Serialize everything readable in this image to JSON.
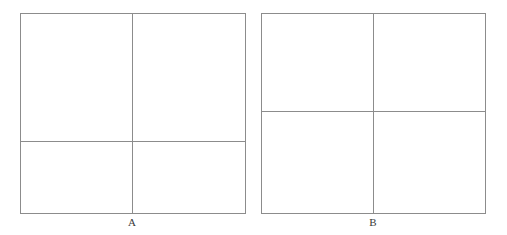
{
  "page": {
    "background_color": "#ffffff",
    "width": 507,
    "height": 235,
    "line_color": "#8c8c8c",
    "label_color": "#3a3a3a"
  },
  "figures": [
    {
      "id": "figure-a",
      "label": "A",
      "frame": {
        "x": 20,
        "y": 13,
        "width": 226,
        "height": 201
      },
      "vertical_divider": {
        "x": 132,
        "y_top": 13,
        "y_bottom": 214
      },
      "horizontal_divider": {
        "y": 141,
        "x_left": 20,
        "x_right": 246
      },
      "label_position": {
        "x": 132,
        "y": 216
      }
    },
    {
      "id": "figure-b",
      "label": "B",
      "frame": {
        "x": 261,
        "y": 13,
        "width": 225,
        "height": 201
      },
      "vertical_divider": {
        "x": 373,
        "y_top": 13,
        "y_bottom": 214
      },
      "horizontal_divider": {
        "y": 111,
        "x_left": 261,
        "x_right": 486
      },
      "label_position": {
        "x": 373,
        "y": 216
      }
    }
  ],
  "chart_data": {
    "type": "diagram",
    "title": "",
    "panels": [
      {
        "name": "A",
        "shape": "square",
        "vertical_split_fraction": 0.496,
        "horizontal_split_fraction": 0.637,
        "regions": [
          {
            "position": "top-left",
            "width_fraction": 0.496,
            "height_fraction": 0.637
          },
          {
            "position": "top-right",
            "width_fraction": 0.504,
            "height_fraction": 0.637
          },
          {
            "position": "bottom-left",
            "width_fraction": 0.496,
            "height_fraction": 0.363
          },
          {
            "position": "bottom-right",
            "width_fraction": 0.504,
            "height_fraction": 0.363
          }
        ]
      },
      {
        "name": "B",
        "shape": "square",
        "vertical_split_fraction": 0.498,
        "horizontal_split_fraction": 0.488,
        "regions": [
          {
            "position": "top-left",
            "width_fraction": 0.498,
            "height_fraction": 0.488
          },
          {
            "position": "top-right",
            "width_fraction": 0.502,
            "height_fraction": 0.488
          },
          {
            "position": "bottom-left",
            "width_fraction": 0.498,
            "height_fraction": 0.512
          },
          {
            "position": "bottom-right",
            "width_fraction": 0.502,
            "height_fraction": 0.512
          }
        ]
      }
    ],
    "labels": [
      "A",
      "B"
    ]
  }
}
